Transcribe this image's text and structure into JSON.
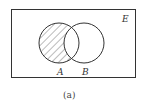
{
  "diagram": {
    "type": "venn",
    "universe_label": "E",
    "sets": [
      {
        "label": "A",
        "cx": 59,
        "cy": 43,
        "r": 20
      },
      {
        "label": "B",
        "cx": 84,
        "cy": 43,
        "r": 20
      }
    ],
    "shaded_region": "A minus B",
    "caption": "(a)",
    "colors": {
      "stroke": "#333333",
      "hatch": "#555555",
      "background": "#ffffff"
    }
  }
}
